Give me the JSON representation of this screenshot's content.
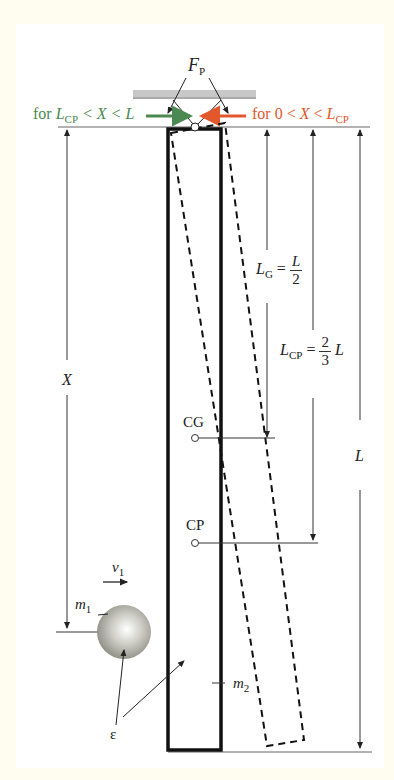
{
  "figure": {
    "type": "physics-diagram"
  },
  "labels": {
    "force": "F",
    "force_sub": "P",
    "green_range": {
      "prefix": "for ",
      "L": "L",
      "L_sub": "CP",
      "middle": " < X < ",
      "end": "L"
    },
    "red_range": {
      "prefix": "for 0 < ",
      "X": "X",
      "middle": " < ",
      "L": "L",
      "L_sub": "CP"
    },
    "lg": {
      "L": "L",
      "sub": "G",
      "eq": " = ",
      "num": "L",
      "den": "2"
    },
    "lcp": {
      "L": "L",
      "sub": "CP",
      "eq": " = ",
      "num": "2",
      "den": "3",
      "tail": "L"
    },
    "x_dim": "X",
    "l_dim": "L",
    "cg": "CG",
    "cp": "CP",
    "velocity": "v",
    "velocity_sub": "1",
    "mass1": "m",
    "mass1_sub": "1",
    "mass2": "m",
    "mass2_sub": "2",
    "epsilon": "ε"
  },
  "colors": {
    "background_frame": "#fffdf0",
    "panel": "#ffffff",
    "green_arrow": "#4a8a52",
    "red_arrow": "#e2582c",
    "pivot_bar": "#c8c8c8",
    "ink": "#111111"
  }
}
